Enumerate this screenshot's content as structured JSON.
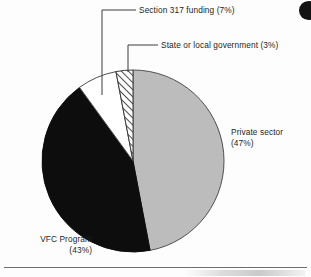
{
  "figure": {
    "background_color": "#fdfdfd",
    "rule_color": "#6e6e6e"
  },
  "labels": {
    "section_317": "Section 317 funding (7%)",
    "state_or_local": "State or local government (3%)",
    "private_sector_line1": "Private sector",
    "private_sector_line2": "(47%)",
    "vfc_program_line1": "VFC Program",
    "vfc_program_line2": "(43%)"
  },
  "chart_data": {
    "type": "pie",
    "title": "",
    "subtitle": "",
    "xlabel": "",
    "ylabel": "",
    "grid": false,
    "legend_position": "none",
    "label_format": "name (percent)",
    "start_angle_deg": -90,
    "direction": "clockwise",
    "center_px": [
      133,
      161
    ],
    "radius_px": 91,
    "categories": [
      "Private sector",
      "VFC Program",
      "Section 317 funding",
      "State or local government"
    ],
    "values": [
      47,
      43,
      7,
      3
    ],
    "units": "percent",
    "total": 100,
    "slices": [
      {
        "name": "Private sector",
        "value": 47,
        "label": "Private sector (47%)",
        "fill": "#bcbcbc",
        "pattern": "solid",
        "stroke": "#4f4f4f",
        "start_deg": 0.0,
        "end_deg": 169.2,
        "label_position": "right-outside"
      },
      {
        "name": "VFC Program",
        "value": 43,
        "label": "VFC Program (43%)",
        "fill": "#0d0d0d",
        "pattern": "solid",
        "stroke": "#0d0d0d",
        "start_deg": 169.2,
        "end_deg": 324.0,
        "label_position": "bottom-left-outside"
      },
      {
        "name": "Section 317 funding",
        "value": 7,
        "label": "Section 317 funding (7%)",
        "fill": "#ffffff",
        "pattern": "solid",
        "stroke": "#4f4f4f",
        "start_deg": 324.0,
        "end_deg": 349.2,
        "label_position": "top-leader-line"
      },
      {
        "name": "State or local government",
        "value": 3,
        "label": "State or local government (3%)",
        "fill": "#ffffff",
        "pattern": "diagonal-hatch",
        "stroke": "#3a3a3a",
        "start_deg": 349.2,
        "end_deg": 360.0,
        "label_position": "top-leader-line"
      }
    ],
    "annotations": [
      {
        "name": "section-317-leader",
        "text": "Section 317 funding (7%)",
        "elbow_px": [
          102,
          10
        ],
        "tip_px": [
          102,
          95
        ],
        "text_anchor_px": [
          139,
          10
        ]
      },
      {
        "name": "state-or-local-leader",
        "text": "State or local government (3%)",
        "elbow_px": [
          128,
          45
        ],
        "tip_px": [
          128,
          72
        ],
        "text_anchor_px": [
          161,
          45
        ]
      }
    ]
  }
}
